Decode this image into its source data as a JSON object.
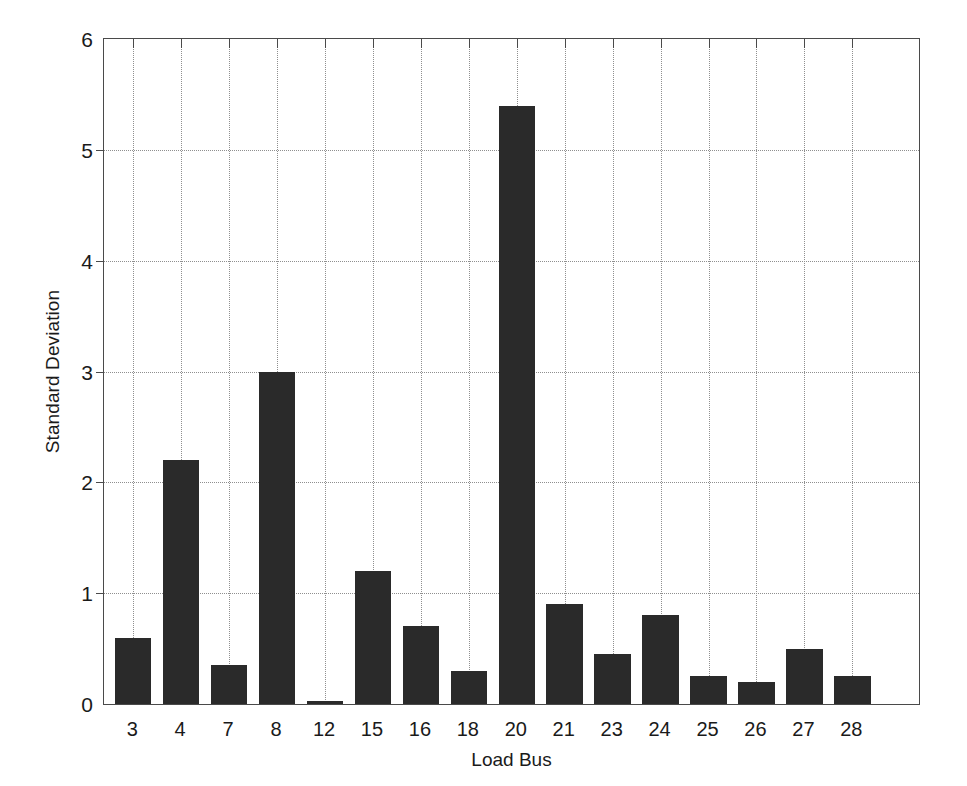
{
  "chart_data": {
    "type": "bar",
    "title": "",
    "xlabel": "Load Bus",
    "ylabel": "Standard Deviation",
    "categories": [
      "3",
      "4",
      "7",
      "8",
      "12",
      "15",
      "16",
      "18",
      "20",
      "21",
      "23",
      "24",
      "25",
      "26",
      "27",
      "28"
    ],
    "values": [
      0.6,
      2.2,
      0.35,
      3.0,
      0.03,
      1.2,
      0.7,
      0.3,
      5.4,
      0.9,
      0.45,
      0.8,
      0.25,
      0.2,
      0.5,
      0.25
    ],
    "ylim": [
      0,
      6
    ],
    "yticks": [
      0,
      1,
      2,
      3,
      4,
      5,
      6
    ],
    "ytick_labels": [
      "0",
      "1",
      "2",
      "3",
      "4",
      "5",
      "6"
    ],
    "grid": true,
    "grid_style": "dotted",
    "legend": null,
    "bar_color": "#2a2a2a",
    "axis_color": "#4a4a4a",
    "grid_color": "#8f8f8f",
    "background": "#ffffff"
  }
}
